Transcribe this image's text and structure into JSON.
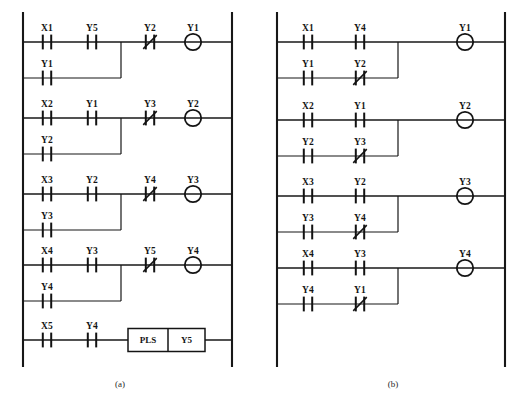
{
  "figure": {
    "title": "",
    "panels": [
      {
        "id": "a",
        "caption": "(a)",
        "rungs": [
          {
            "main_contacts": [
              {
                "label": "X1",
                "type": "NO"
              },
              {
                "label": "Y5",
                "type": "NO"
              }
            ],
            "branch_contacts": [
              {
                "label": "Y1",
                "type": "NO"
              }
            ],
            "series_contacts": [
              {
                "label": "Y2",
                "type": "NC"
              }
            ],
            "output": {
              "label": "Y1",
              "type": "coil"
            }
          },
          {
            "main_contacts": [
              {
                "label": "X2",
                "type": "NO"
              },
              {
                "label": "Y1",
                "type": "NO"
              }
            ],
            "branch_contacts": [
              {
                "label": "Y2",
                "type": "NO"
              }
            ],
            "series_contacts": [
              {
                "label": "Y3",
                "type": "NC"
              }
            ],
            "output": {
              "label": "Y2",
              "type": "coil"
            }
          },
          {
            "main_contacts": [
              {
                "label": "X3",
                "type": "NO"
              },
              {
                "label": "Y2",
                "type": "NO"
              }
            ],
            "branch_contacts": [
              {
                "label": "Y3",
                "type": "NO"
              }
            ],
            "series_contacts": [
              {
                "label": "Y4",
                "type": "NC"
              }
            ],
            "output": {
              "label": "Y3",
              "type": "coil"
            }
          },
          {
            "main_contacts": [
              {
                "label": "X4",
                "type": "NO"
              },
              {
                "label": "Y3",
                "type": "NO"
              }
            ],
            "branch_contacts": [
              {
                "label": "Y4",
                "type": "NO"
              }
            ],
            "series_contacts": [
              {
                "label": "Y5",
                "type": "NC"
              }
            ],
            "output": {
              "label": "Y4",
              "type": "coil"
            }
          },
          {
            "main_contacts": [
              {
                "label": "X5",
                "type": "NO"
              },
              {
                "label": "Y4",
                "type": "NO"
              }
            ],
            "branch_contacts": [],
            "series_contacts": [],
            "output": {
              "type": "function-block",
              "instruction": "PLS",
              "operand": "Y5"
            }
          }
        ]
      },
      {
        "id": "b",
        "caption": "(b)",
        "rungs": [
          {
            "main_contacts": [
              {
                "label": "X1",
                "type": "NO"
              },
              {
                "label": "Y4",
                "type": "NO"
              }
            ],
            "branch_contacts": [
              {
                "label": "Y1",
                "type": "NO"
              },
              {
                "label": "Y2",
                "type": "NC"
              }
            ],
            "series_contacts": [],
            "output": {
              "label": "Y1",
              "type": "coil"
            }
          },
          {
            "main_contacts": [
              {
                "label": "X2",
                "type": "NO"
              },
              {
                "label": "Y1",
                "type": "NO"
              }
            ],
            "branch_contacts": [
              {
                "label": "Y2",
                "type": "NO"
              },
              {
                "label": "Y3",
                "type": "NC"
              }
            ],
            "series_contacts": [],
            "output": {
              "label": "Y2",
              "type": "coil"
            }
          },
          {
            "main_contacts": [
              {
                "label": "X3",
                "type": "NO"
              },
              {
                "label": "Y2",
                "type": "NO"
              }
            ],
            "branch_contacts": [
              {
                "label": "Y3",
                "type": "NO"
              },
              {
                "label": "Y4",
                "type": "NC"
              }
            ],
            "series_contacts": [],
            "output": {
              "label": "Y3",
              "type": "coil"
            }
          },
          {
            "main_contacts": [
              {
                "label": "X4",
                "type": "NO"
              },
              {
                "label": "Y3",
                "type": "NO"
              }
            ],
            "branch_contacts": [
              {
                "label": "Y4",
                "type": "NO"
              },
              {
                "label": "Y1",
                "type": "NC"
              }
            ],
            "series_contacts": [],
            "output": {
              "label": "Y4",
              "type": "coil"
            }
          }
        ]
      }
    ],
    "figure_caption": "",
    "colors": {
      "line": "#171717",
      "text": "#141414",
      "background": "#ffffff"
    }
  },
  "geometry": {
    "panel_a": {
      "rail_left_x": 23,
      "rail_right_x": 232,
      "rail_top_y": 12,
      "rail_bottom_y": 367,
      "contact_x": [
        47,
        92
      ],
      "junction_x": 121,
      "series_x": [
        150
      ],
      "coil_x": 193,
      "rung_y": [
        42,
        118,
        194,
        265,
        340
      ],
      "branch_offset": 36,
      "block_x0": 128,
      "block_x1": 205,
      "block_split_x": 168
    },
    "panel_b": {
      "rail_left_x": 277,
      "rail_right_x": 505,
      "rail_top_y": 12,
      "rail_bottom_y": 367,
      "contact_x": [
        308,
        360
      ],
      "junction_x": 398,
      "coil_x": 465,
      "rung_y": [
        42,
        120,
        196,
        268
      ],
      "branch_offset": 36
    },
    "caption_a": {
      "x": 120,
      "y": 387
    },
    "caption_b": {
      "x": 393,
      "y": 387
    }
  }
}
